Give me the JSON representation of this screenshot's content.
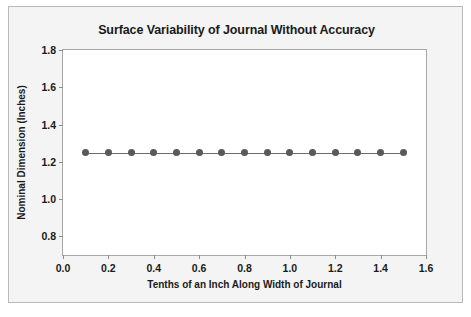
{
  "chart_data": {
    "type": "line",
    "title": "Surface Variability of Journal Without Accuracy",
    "xlabel": "Tenths of an Inch Along Width of Journal",
    "ylabel": "Nominal Dimension (Inches)",
    "xlim": [
      0.0,
      1.6
    ],
    "ylim": [
      0.7,
      1.8
    ],
    "grid": false,
    "legend": null,
    "xticks": [
      "0.0",
      "0.2",
      "0.4",
      "0.6",
      "0.8",
      "1.0",
      "1.2",
      "1.4",
      "1.6"
    ],
    "xtick_values": [
      0.0,
      0.2,
      0.4,
      0.6,
      0.8,
      1.0,
      1.2,
      1.4,
      1.6
    ],
    "yticks": [
      "0.8",
      "1.0",
      "1.2",
      "1.4",
      "1.6",
      "1.8"
    ],
    "ytick_values": [
      0.8,
      1.0,
      1.2,
      1.4,
      1.6,
      1.8
    ],
    "series": [
      {
        "name": "Nominal Dimension",
        "marker": "filled-circle",
        "color": "#595959",
        "line_color": "#6b6b6b",
        "x": [
          0.1,
          0.2,
          0.3,
          0.4,
          0.5,
          0.6,
          0.7,
          0.8,
          0.9,
          1.0,
          1.1,
          1.2,
          1.3,
          1.4,
          1.5
        ],
        "values": [
          1.25,
          1.25,
          1.25,
          1.25,
          1.25,
          1.25,
          1.25,
          1.25,
          1.25,
          1.25,
          1.25,
          1.25,
          1.25,
          1.25,
          1.25
        ]
      }
    ]
  },
  "colors": {
    "figure_background": "#f4f4f4",
    "plot_background": "#ffffff",
    "frame_border": "#a8a8a8",
    "outer_border": "#b9b9b9",
    "text": "#1a1a1a",
    "marker": "#595959",
    "line": "#6b6b6b"
  }
}
